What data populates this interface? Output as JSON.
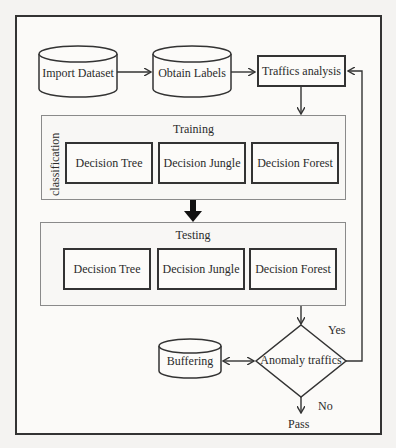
{
  "diagram": {
    "nodes": {
      "import_dataset": "Import Dataset",
      "obtain_labels": "Obtain Labels",
      "traffics_analysis": "Traffics analysis",
      "buffering": "Buffering",
      "anomaly_traffics": "Anomaly traffics",
      "pass": "Pass"
    },
    "training": {
      "title": "Training",
      "side_label": "classification",
      "models": [
        "Decision Tree",
        "Decision Jungle",
        "Decision Forest"
      ]
    },
    "testing": {
      "title": "Testing",
      "models": [
        "Decision Tree",
        "Decision Jungle",
        "Decision Forest"
      ]
    },
    "edge_labels": {
      "yes": "Yes",
      "no": "No"
    }
  }
}
